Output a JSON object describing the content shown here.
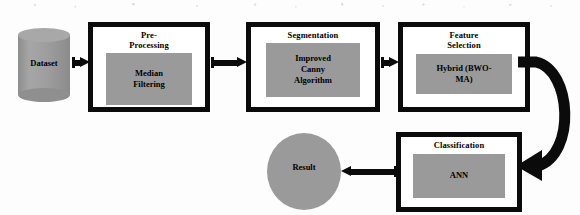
{
  "figure": {
    "kind": "methodology-flowchart",
    "colors": {
      "stroke": "#0b0b0b",
      "inner_fill": "#9a9a9a",
      "box_fill": "#ffffff",
      "page": "#ffffff"
    }
  },
  "nodes": {
    "dataset": {
      "label": "Dataset",
      "shape": "cylinder"
    },
    "pre_processing": {
      "title": "Pre-\nProcessing",
      "inner": "Median\nFiltering"
    },
    "segmentation": {
      "title": "Segmentation",
      "inner": "Improved\nCanny\nAlgorithm"
    },
    "feature_selection": {
      "title": "Feature\nSelection",
      "inner": "Hybrid  (BWO-\nMA)"
    },
    "classification": {
      "title": "Classification",
      "inner": "ANN"
    },
    "result": {
      "label": "Result",
      "shape": "circle"
    }
  },
  "edges": [
    {
      "name": "dataset-to-pre-processing",
      "from": "dataset",
      "to": "pre_processing",
      "style": "straight-arrow",
      "direction": "right"
    },
    {
      "name": "pre-processing-to-segmentation",
      "from": "pre_processing",
      "to": "segmentation",
      "style": "straight-arrow",
      "direction": "right"
    },
    {
      "name": "segmentation-to-feature-selection",
      "from": "segmentation",
      "to": "feature_selection",
      "style": "straight-arrow",
      "direction": "right"
    },
    {
      "name": "feature-selection-to-classification",
      "from": "feature_selection",
      "to": "classification",
      "style": "curved-arrow",
      "direction": "down-left"
    },
    {
      "name": "classification-to-result",
      "from": "classification",
      "to": "result",
      "style": "straight-arrow",
      "direction": "left"
    }
  ]
}
